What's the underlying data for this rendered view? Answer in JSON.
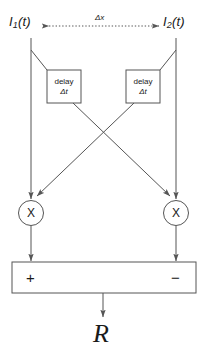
{
  "diagram": {
    "inputs": {
      "left": {
        "base": "I",
        "sub": "1",
        "arg": "(t)"
      },
      "right": {
        "base": "I",
        "sub": "2",
        "arg": "(t)"
      }
    },
    "spacing": {
      "label": "Δx"
    },
    "delay_blocks": [
      {
        "line1": "delay",
        "line2": "Δt"
      },
      {
        "line1": "delay",
        "line2": "Δt"
      }
    ],
    "multipliers": [
      {
        "symbol": "X"
      },
      {
        "symbol": "X"
      }
    ],
    "summation": {
      "plus": "+",
      "minus": "−"
    },
    "output": {
      "label": "R"
    },
    "colors": {
      "stroke": "#555555",
      "text": "#1a1a1a",
      "background": "#ffffff"
    }
  }
}
